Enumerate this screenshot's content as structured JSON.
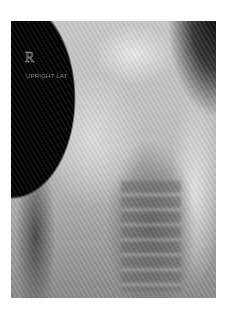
{
  "image": {
    "description": "Lateral chest radiograph (X-ray)",
    "marker": "R",
    "label": "UPRIGHT LAT"
  }
}
